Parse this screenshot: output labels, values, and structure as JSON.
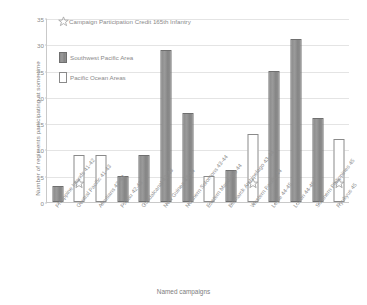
{
  "chart_data": {
    "type": "bar",
    "title": "",
    "xlabel": "Named campaigns",
    "ylabel": "Number of regiments participating at some time",
    "ylim": [
      0,
      35
    ],
    "yticks": [
      0,
      5,
      10,
      15,
      20,
      25,
      30,
      35
    ],
    "grid": true,
    "legend_position": "top-left",
    "categories": [
      "Philippine Islands 41-42",
      "Central Pacific 41-43",
      "Aleutians 42-43",
      "Papau 42-43",
      "Guadalcanal 42-43",
      "New Guinea 43-44",
      "Northern Solomons 43-44",
      "Eastern Mandates 44",
      "Bismarck Archipelago 43-44",
      "Western Pacific 44",
      "Leyte 44-45",
      "Luzon 44-45",
      "Southern Philippines 45",
      "Ryukyus 45"
    ],
    "values": [
      3,
      9,
      9,
      5,
      9,
      29,
      17,
      5,
      6,
      13,
      25,
      31,
      16,
      12
    ],
    "series_of_bar": [
      "Southwest Pacific Area",
      "Pacific Ocean Areas",
      "Pacific Ocean Areas",
      "Southwest Pacific Area",
      "Southwest Pacific Area",
      "Southwest Pacific Area",
      "Southwest Pacific Area",
      "Pacific Ocean Areas",
      "Southwest Pacific Area",
      "Pacific Ocean Areas",
      "Southwest Pacific Area",
      "Southwest Pacific Area",
      "Southwest Pacific Area",
      "Pacific Ocean Areas"
    ],
    "star_markers": [
      {
        "category": "Central Pacific 41-43",
        "index": 1,
        "value": 3.5
      },
      {
        "category": "Western Pacific 44",
        "index": 9,
        "value": 3.5
      },
      {
        "category": "Ryukyus 45",
        "index": 13,
        "value": 3.5
      }
    ],
    "colors": {
      "southwest_pacific_area": "#909090",
      "pacific_ocean_areas": "#ffffff",
      "axis": "#c9c9c9",
      "grid": "#e4e4e4",
      "text": "#8a8a8a"
    }
  },
  "legend": {
    "star_entry": "Campaign Participation Credit 165th Infantry",
    "items": [
      {
        "label": "Southwest Pacific Area",
        "swatch": "sw"
      },
      {
        "label": "Pacific Ocean Areas",
        "swatch": "po"
      }
    ]
  }
}
